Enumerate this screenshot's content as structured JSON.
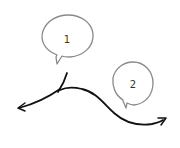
{
  "diagram": {
    "background": "#ffffff",
    "stroke_color": "#111111",
    "bubble_stroke_color": "#8a8a8a",
    "callouts": [
      {
        "label": "1",
        "cx": 67,
        "cy": 39,
        "rx": 26,
        "ry": 20
      },
      {
        "label": "2",
        "cx": 133,
        "cy": 84,
        "rx": 20,
        "ry": 22
      }
    ],
    "arrows": [
      {
        "name": "left-arrow",
        "direction": "left"
      },
      {
        "name": "right-arrow",
        "direction": "right"
      }
    ]
  }
}
